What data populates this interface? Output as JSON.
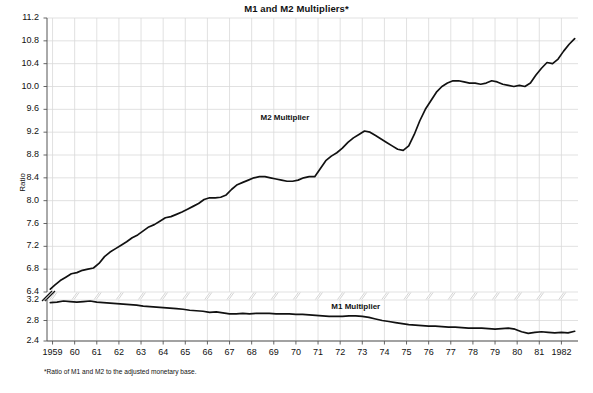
{
  "chart_data": {
    "type": "line",
    "title": "M1 and M2 Multipliers*",
    "xlabel": "",
    "ylabel": "Ratio",
    "footnote": "*Ratio of M1 and M2 to the adjusted monetary base.",
    "grid": true,
    "legend_position": "inline-annotation",
    "axis_break": {
      "between": [
        6.4,
        3.2
      ],
      "note": "y-axis broken between 6.4 and 3.2"
    },
    "yticks_upper": [
      "11.2",
      "10.8",
      "10.4",
      "10.0",
      "9.6",
      "9.2",
      "8.8",
      "8.4",
      "8.0",
      "7.6",
      "7.2",
      "6.8",
      "6.4"
    ],
    "yticks_lower": [
      "3.2",
      "2.8",
      "2.4"
    ],
    "ylim_upper": [
      6.4,
      11.2
    ],
    "ylim_lower": [
      2.4,
      3.2
    ],
    "xlim": [
      1958.75,
      1982.75
    ],
    "xticks": [
      "1959",
      "60",
      "61",
      "62",
      "63",
      "64",
      "65",
      "66",
      "67",
      "68",
      "69",
      "70",
      "71",
      "72",
      "73",
      "74",
      "75",
      "76",
      "77",
      "78",
      "79",
      "80",
      "81",
      "1982"
    ],
    "xtick_values": [
      1959,
      1960,
      1961,
      1962,
      1963,
      1964,
      1965,
      1966,
      1967,
      1968,
      1969,
      1970,
      1971,
      1972,
      1973,
      1974,
      1975,
      1976,
      1977,
      1978,
      1979,
      1980,
      1981,
      1982
    ],
    "series": [
      {
        "name": "M2 Multiplier",
        "label_x": 1968.4,
        "label_y": 9.45,
        "color": "#111111",
        "x": [
          1958.9,
          1959.1,
          1959.35,
          1959.6,
          1959.85,
          1960.1,
          1960.35,
          1960.6,
          1960.85,
          1961.1,
          1961.35,
          1961.6,
          1961.85,
          1962.1,
          1962.35,
          1962.6,
          1962.85,
          1963.1,
          1963.35,
          1963.6,
          1963.85,
          1964.1,
          1964.35,
          1964.6,
          1964.85,
          1965.1,
          1965.35,
          1965.6,
          1965.85,
          1966.1,
          1966.35,
          1966.6,
          1966.85,
          1967.1,
          1967.35,
          1967.6,
          1967.85,
          1968.1,
          1968.35,
          1968.6,
          1968.85,
          1969.1,
          1969.35,
          1969.6,
          1969.85,
          1970.1,
          1970.35,
          1970.6,
          1970.85,
          1971.1,
          1971.35,
          1971.6,
          1971.85,
          1972.1,
          1972.35,
          1972.6,
          1972.85,
          1973.1,
          1973.35,
          1973.6,
          1973.85,
          1974.1,
          1974.35,
          1974.6,
          1974.85,
          1975.1,
          1975.35,
          1975.6,
          1975.85,
          1976.1,
          1976.35,
          1976.6,
          1976.85,
          1977.1,
          1977.35,
          1977.6,
          1977.85,
          1978.1,
          1978.35,
          1978.6,
          1978.85,
          1979.1,
          1979.35,
          1979.6,
          1979.85,
          1980.1,
          1980.35,
          1980.6,
          1980.85,
          1981.1,
          1981.35,
          1981.6,
          1981.85,
          1982.1,
          1982.35,
          1982.6
        ],
        "y": [
          6.45,
          6.52,
          6.6,
          6.66,
          6.72,
          6.74,
          6.78,
          6.8,
          6.82,
          6.9,
          7.02,
          7.1,
          7.16,
          7.22,
          7.28,
          7.35,
          7.4,
          7.47,
          7.54,
          7.58,
          7.64,
          7.7,
          7.72,
          7.76,
          7.8,
          7.85,
          7.9,
          7.95,
          8.02,
          8.05,
          8.05,
          8.06,
          8.1,
          8.2,
          8.28,
          8.32,
          8.36,
          8.4,
          8.42,
          8.42,
          8.4,
          8.38,
          8.36,
          8.34,
          8.34,
          8.36,
          8.4,
          8.42,
          8.42,
          8.56,
          8.7,
          8.78,
          8.84,
          8.92,
          9.02,
          9.1,
          9.16,
          9.22,
          9.2,
          9.14,
          9.08,
          9.02,
          8.96,
          8.9,
          8.88,
          8.96,
          9.16,
          9.4,
          9.6,
          9.75,
          9.9,
          10.0,
          10.06,
          10.1,
          10.1,
          10.08,
          10.06,
          10.06,
          10.04,
          10.06,
          10.1,
          10.08,
          10.04,
          10.02,
          10.0,
          10.02,
          10.0,
          10.06,
          10.2,
          10.32,
          10.42,
          10.4,
          10.48,
          10.62,
          10.74,
          10.84
        ]
      },
      {
        "name": "M1 Multiplier",
        "label_x": 1971.6,
        "label_y": 3.065,
        "color": "#111111",
        "x": [
          1958.9,
          1959.2,
          1959.5,
          1959.8,
          1960.1,
          1960.4,
          1960.7,
          1961.0,
          1961.3,
          1961.6,
          1961.9,
          1962.2,
          1962.5,
          1962.8,
          1963.1,
          1963.4,
          1963.7,
          1964.0,
          1964.3,
          1964.6,
          1964.9,
          1965.2,
          1965.5,
          1965.8,
          1966.1,
          1966.4,
          1966.7,
          1967.0,
          1967.3,
          1967.6,
          1967.9,
          1968.2,
          1968.5,
          1968.8,
          1969.1,
          1969.4,
          1969.7,
          1970.0,
          1970.3,
          1970.6,
          1970.9,
          1971.2,
          1971.5,
          1971.8,
          1972.1,
          1972.4,
          1972.7,
          1973.0,
          1973.3,
          1973.6,
          1973.9,
          1974.2,
          1974.5,
          1974.8,
          1975.1,
          1975.4,
          1975.7,
          1976.0,
          1976.3,
          1976.6,
          1976.9,
          1977.2,
          1977.5,
          1977.8,
          1978.1,
          1978.4,
          1978.7,
          1979.0,
          1979.3,
          1979.6,
          1979.9,
          1980.2,
          1980.5,
          1980.8,
          1981.1,
          1981.4,
          1981.7,
          1982.0,
          1982.3,
          1982.6
        ],
        "y": [
          3.15,
          3.16,
          3.18,
          3.17,
          3.16,
          3.17,
          3.18,
          3.16,
          3.15,
          3.14,
          3.13,
          3.12,
          3.11,
          3.1,
          3.08,
          3.07,
          3.06,
          3.05,
          3.04,
          3.03,
          3.02,
          3.0,
          2.99,
          2.98,
          2.96,
          2.97,
          2.95,
          2.93,
          2.93,
          2.94,
          2.93,
          2.94,
          2.94,
          2.94,
          2.93,
          2.93,
          2.93,
          2.92,
          2.92,
          2.91,
          2.9,
          2.89,
          2.88,
          2.88,
          2.88,
          2.89,
          2.89,
          2.88,
          2.86,
          2.83,
          2.8,
          2.78,
          2.76,
          2.74,
          2.72,
          2.71,
          2.7,
          2.69,
          2.69,
          2.68,
          2.67,
          2.67,
          2.66,
          2.65,
          2.65,
          2.65,
          2.64,
          2.63,
          2.64,
          2.65,
          2.63,
          2.58,
          2.55,
          2.57,
          2.58,
          2.57,
          2.56,
          2.57,
          2.56,
          2.59
        ]
      }
    ]
  },
  "style": {
    "grid_color": "#d9d9d9",
    "axis_color": "#888888",
    "line_color": "#111111",
    "background": "#ffffff"
  }
}
